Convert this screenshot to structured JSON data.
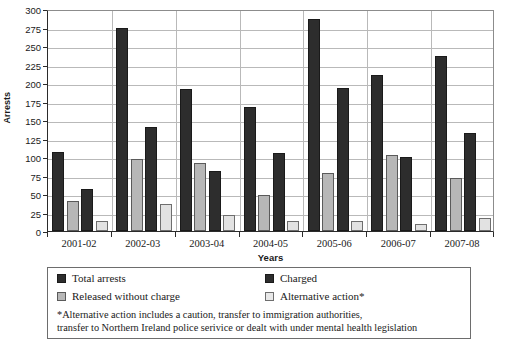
{
  "chart_data": {
    "type": "bar",
    "title": "",
    "xlabel": "Years",
    "ylabel": "Arrests",
    "ylim": [
      0,
      300
    ],
    "ytick_step": 25,
    "yticks": [
      0,
      25,
      50,
      75,
      100,
      125,
      150,
      175,
      200,
      225,
      250,
      275,
      300
    ],
    "ytick_labels": [
      "0",
      "25",
      "50",
      "75",
      "100",
      "125",
      "150",
      "175",
      "200",
      "225",
      "250",
      "275",
      "300"
    ],
    "grid": true,
    "legend_position": "below-plot",
    "categories": [
      "2001-02",
      "2002-03",
      "2003-04",
      "2004-05",
      "2005-06",
      "2006-07",
      "2007-08"
    ],
    "series": [
      {
        "name": "Total arrests",
        "values": [
          107,
          274,
          192,
          167,
          286,
          211,
          236
        ]
      },
      {
        "name": "Released without charge",
        "values": [
          40,
          97,
          92,
          48,
          79,
          103,
          71
        ]
      },
      {
        "name": "Charged",
        "values": [
          57,
          140,
          81,
          105,
          193,
          100,
          133
        ]
      },
      {
        "name": "Alternative action*",
        "values": [
          13,
          37,
          22,
          13,
          14,
          10,
          18
        ]
      }
    ],
    "annotations": [
      "*Alternative action includes a caution, transfer to immigration authorities,",
      "transfer to Northern Ireland police serivice or dealt with under mental health legislation"
    ]
  },
  "colors": {
    "series_total_arrests": "#2d2d2d",
    "series_released_without_charge": "#b7b7b7",
    "series_charged": "#2d2d2d",
    "series_alternative_action": "#e2e2e2",
    "gridline": "#b9b9b9",
    "axis": "#2b2b2b",
    "legend_border": "#6d6d6d",
    "background": "#ffffff"
  },
  "legend": {
    "items": [
      {
        "label": "Total arrests"
      },
      {
        "label": "Released without charge"
      },
      {
        "label": "Charged"
      },
      {
        "label": "Alternative action*"
      }
    ],
    "note_line_1": "*Alternative action includes a caution, transfer to immigration authorities,",
    "note_line_2": "transfer to Northern Ireland police serivice or dealt with under mental health legislation"
  }
}
